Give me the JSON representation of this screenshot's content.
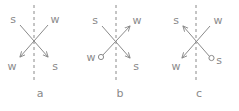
{
  "figure": {
    "type": "vector-diagram",
    "panel_count": 3,
    "colors": {
      "line": "#8a8a8a",
      "text": "#8a8a8a",
      "background": "#ffffff",
      "marker_fill": "#ffffff"
    },
    "shared": {
      "dashed_line_label": "interface-dashed-line",
      "dash_pattern": "3 3"
    },
    "panels": [
      {
        "id": "a",
        "caption": "a",
        "labels": {
          "top_left": "s",
          "top_right": "w",
          "bottom_left": "w",
          "bottom_right": "s"
        },
        "arrows": [
          {
            "name": "arrow-down-left",
            "from": "top_right",
            "to": "bottom_left",
            "head": "bottom_left"
          },
          {
            "name": "arrow-down-right",
            "from": "top_left",
            "to": "bottom_right",
            "head": "bottom_right"
          }
        ],
        "circles": []
      },
      {
        "id": "b",
        "caption": "b",
        "labels": {
          "top_left": "s",
          "top_right": "w",
          "bottom_left": "w",
          "bottom_right": "s"
        },
        "arrows": [
          {
            "name": "arrow-up-right",
            "from": "bottom_left",
            "to": "top_right",
            "head": "top_right"
          },
          {
            "name": "arrow-down-right",
            "from": "top_left",
            "to": "bottom_right",
            "head": "bottom_right"
          }
        ],
        "circles": [
          {
            "name": "circle-marker-bottom-left",
            "at": "bottom_left"
          }
        ]
      },
      {
        "id": "c",
        "caption": "c",
        "labels": {
          "top_left": "s",
          "top_right": "w",
          "bottom_left": "w",
          "bottom_right": "s"
        },
        "arrows": [
          {
            "name": "arrow-up-left",
            "from": "bottom_right",
            "to": "top_left",
            "head": "top_left"
          },
          {
            "name": "arrow-down-left",
            "from": "top_right",
            "to": "bottom_left",
            "head": "bottom_left"
          }
        ],
        "circles": [
          {
            "name": "circle-marker-bottom-right",
            "at": "bottom_right"
          }
        ]
      }
    ]
  }
}
